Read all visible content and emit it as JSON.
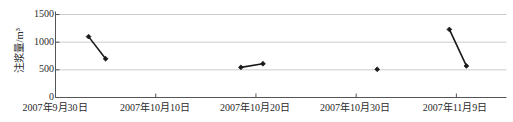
{
  "chart_data": {
    "type": "line",
    "title": "",
    "xlabel": "",
    "ylabel": "注浆量/m³",
    "ylim": [
      0,
      1500
    ],
    "yticks": [
      0,
      500,
      1000,
      1500
    ],
    "ytick_labels": [
      "0",
      "500",
      "1000",
      "1500"
    ],
    "grid": true,
    "grid_axis": "y",
    "legend": "none",
    "xtick_labels": [
      "2007年9月30日",
      "2007年10月10日",
      "2007年10月20日",
      "2007年10月30日",
      "2007年11月9日"
    ],
    "xtick_days": [
      0,
      10,
      20,
      30,
      40
    ],
    "xlim_days": [
      0,
      45
    ],
    "marker": "filled-diamond",
    "line_color": "#1a1a1a",
    "marker_color": "#1a1a1a",
    "series": [
      {
        "name": "segment-1",
        "points": [
          {
            "day": 3.3,
            "value": 1100
          },
          {
            "day": 5.0,
            "value": 700
          }
        ]
      },
      {
        "name": "segment-2",
        "points": [
          {
            "day": 18.5,
            "value": 545
          },
          {
            "day": 20.7,
            "value": 610
          }
        ]
      },
      {
        "name": "point-3",
        "points": [
          {
            "day": 32.1,
            "value": 510
          }
        ]
      },
      {
        "name": "segment-4",
        "points": [
          {
            "day": 39.3,
            "value": 1230
          },
          {
            "day": 41.0,
            "value": 570
          }
        ]
      }
    ]
  },
  "axis_style": {
    "frame_color": "#555555",
    "grid_color": "#cccccc",
    "background": "#ffffff"
  }
}
